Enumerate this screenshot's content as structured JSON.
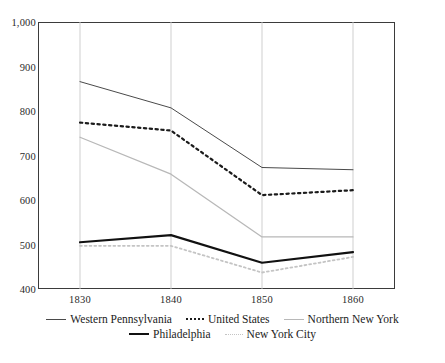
{
  "chart_data": {
    "type": "line",
    "title": "",
    "xlabel": "",
    "ylabel": "",
    "x": [
      1830,
      1840,
      1850,
      1860
    ],
    "xtick_labels": [
      "1830",
      "1840",
      "1850",
      "1860"
    ],
    "ylim": [
      400,
      1000
    ],
    "ytick_labels": [
      "400",
      "500",
      "600",
      "700",
      "800",
      "900",
      "1,000"
    ],
    "ytick_values": [
      400,
      500,
      600,
      700,
      800,
      900,
      1000
    ],
    "grid": "vertical-only",
    "legend_position": "bottom",
    "series": [
      {
        "name": "Western Pennsylvania",
        "style": "solid",
        "color": "#4a4a4a",
        "width": 1.0,
        "values": [
          866,
          807,
          673,
          668
        ]
      },
      {
        "name": "United States",
        "style": "dotted",
        "color": "#1b1b1b",
        "width": 2.2,
        "values": [
          774,
          756,
          611,
          622
        ]
      },
      {
        "name": "Northern New York",
        "style": "solid",
        "color": "#b8b8b8",
        "width": 1.3,
        "values": [
          741,
          658,
          517,
          517
        ]
      },
      {
        "name": "Philadelphia",
        "style": "solid",
        "color": "#111111",
        "width": 2.2,
        "values": [
          505,
          521,
          459,
          483
        ]
      },
      {
        "name": "New York City",
        "style": "dotted",
        "color": "#c4c4c4",
        "width": 1.8,
        "values": [
          497,
          497,
          437,
          472
        ]
      }
    ]
  },
  "legend": {
    "rows": [
      [
        {
          "label": "Western Pennsylvania",
          "swatch": "solid-dark"
        },
        {
          "label": "United States",
          "swatch": "dotted-dark"
        },
        {
          "label": "Northern New York",
          "swatch": "solid-light"
        }
      ],
      [
        {
          "label": "Philadelphia",
          "swatch": "solid-bold"
        },
        {
          "label": "New York City",
          "swatch": "dotted-light"
        }
      ]
    ]
  }
}
